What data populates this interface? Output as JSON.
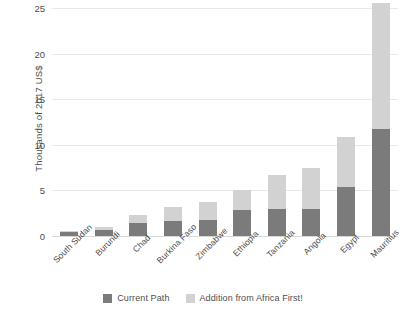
{
  "chart_data": {
    "type": "bar",
    "subtype": "stacked-bar",
    "title": "",
    "xlabel": "",
    "ylabel": "Thousands of 2017 US$",
    "ylim": [
      0,
      25
    ],
    "yticks": [
      0,
      5,
      10,
      15,
      20,
      25
    ],
    "ytick_labels": [
      "0",
      "5",
      "10",
      "15",
      "20",
      "25"
    ],
    "grid": true,
    "legend_position": "bottom-center",
    "categories": [
      "South Sudan",
      "Burundi",
      "Chad",
      "Burkina Faso",
      "Zimbabwe",
      "Ethiopia",
      "Tanzania",
      "Angola",
      "Egypt",
      "Mauritius"
    ],
    "series": [
      {
        "name": "Current Path",
        "color": "#7b7b7b",
        "values": [
          0.4,
          0.7,
          1.4,
          1.7,
          1.8,
          2.9,
          3.0,
          3.0,
          5.4,
          11.7
        ]
      },
      {
        "name": "Addition from Africa First!",
        "color": "#d2d2d2",
        "values": [
          0.2,
          0.3,
          0.9,
          1.5,
          1.9,
          2.1,
          3.7,
          4.5,
          5.5,
          13.8
        ]
      }
    ],
    "totals": [
      0.6,
      1.0,
      2.3,
      3.2,
      3.7,
      5.0,
      6.7,
      7.5,
      10.9,
      25.5
    ]
  },
  "legend": {
    "items": [
      {
        "label": "Current Path",
        "color": "#7b7b7b"
      },
      {
        "label": "Addition from Africa First!",
        "color": "#d2d2d2"
      }
    ]
  },
  "colors": {
    "background": "#ffffff",
    "gridline": "#e8e8e8",
    "baseline": "#d8d8d8",
    "text": "#4d4e50",
    "series_dark": "#7b7b7b",
    "series_light": "#d2d2d2"
  }
}
